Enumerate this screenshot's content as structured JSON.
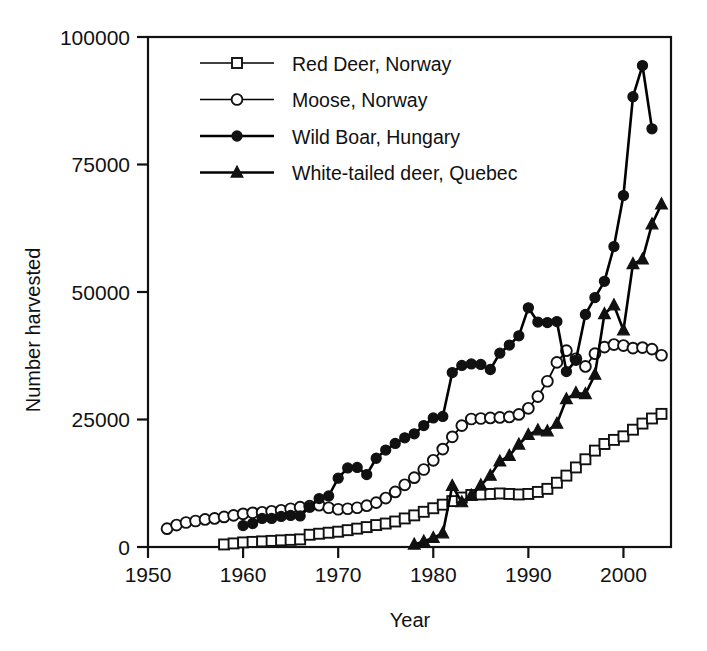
{
  "chart_data": {
    "type": "line",
    "title": "",
    "xlabel": "Year",
    "ylabel": "Number harvested",
    "xlim": [
      1950,
      2005
    ],
    "ylim": [
      0,
      100000
    ],
    "grid": false,
    "legend_position": "top-left-inside",
    "xticks": [
      1950,
      1960,
      1970,
      1980,
      1990,
      2000
    ],
    "yticks": [
      0,
      25000,
      50000,
      75000,
      100000
    ],
    "xtick_labels": [
      "1950",
      "1960",
      "1970",
      "1980",
      "1990",
      "2000"
    ],
    "ytick_labels": [
      "0",
      "25000",
      "50000",
      "75000",
      "100000"
    ],
    "series": [
      {
        "name": "Red Deer, Norway",
        "marker": "open-square",
        "color": "#000000",
        "x": [
          1958,
          1959,
          1960,
          1961,
          1962,
          1963,
          1964,
          1965,
          1966,
          1967,
          1968,
          1969,
          1970,
          1971,
          1972,
          1973,
          1974,
          1975,
          1976,
          1977,
          1978,
          1979,
          1980,
          1981,
          1982,
          1983,
          1984,
          1985,
          1986,
          1987,
          1988,
          1989,
          1990,
          1991,
          1992,
          1993,
          1994,
          1995,
          1996,
          1997,
          1998,
          1999,
          2000,
          2001,
          2002,
          2003,
          2004
        ],
        "y": [
          500,
          700,
          900,
          1000,
          1100,
          1200,
          1300,
          1400,
          1500,
          2400,
          2600,
          2800,
          3000,
          3300,
          3600,
          3900,
          4300,
          4600,
          5000,
          5600,
          6200,
          6900,
          7600,
          8300,
          9000,
          9700,
          10200,
          10300,
          10400,
          10500,
          10400,
          10300,
          10400,
          10800,
          11400,
          12600,
          14000,
          15600,
          17200,
          18900,
          20200,
          21000,
          21700,
          23000,
          24200,
          25200,
          26100
        ]
      },
      {
        "name": "Moose, Norway",
        "marker": "open-circle",
        "color": "#000000",
        "x": [
          1952,
          1953,
          1954,
          1955,
          1956,
          1957,
          1958,
          1959,
          1960,
          1961,
          1962,
          1963,
          1964,
          1965,
          1966,
          1967,
          1968,
          1969,
          1970,
          1971,
          1972,
          1973,
          1974,
          1975,
          1976,
          1977,
          1978,
          1979,
          1980,
          1981,
          1982,
          1983,
          1984,
          1985,
          1986,
          1987,
          1988,
          1989,
          1990,
          1991,
          1992,
          1993,
          1994,
          1995,
          1996,
          1997,
          1998,
          1999,
          2000,
          2001,
          2002,
          2003,
          2004
        ],
        "y": [
          3600,
          4300,
          4800,
          5100,
          5400,
          5600,
          5900,
          6200,
          6500,
          6700,
          6800,
          7000,
          7200,
          7500,
          7800,
          8000,
          8200,
          7700,
          7400,
          7500,
          7700,
          8100,
          8700,
          9600,
          10800,
          12200,
          13600,
          15200,
          17000,
          19200,
          21600,
          23800,
          25100,
          25200,
          25300,
          25400,
          25500,
          26000,
          27200,
          29500,
          32500,
          36200,
          38500,
          36900,
          35400,
          37900,
          39200,
          39700,
          39500,
          39000,
          39100,
          38800,
          37600
        ]
      },
      {
        "name": "Wild Boar, Hungary",
        "marker": "filled-circle",
        "color": "#000000",
        "x": [
          1960,
          1961,
          1962,
          1963,
          1964,
          1965,
          1966,
          1967,
          1968,
          1969,
          1970,
          1971,
          1972,
          1973,
          1974,
          1975,
          1976,
          1977,
          1978,
          1979,
          1980,
          1981,
          1982,
          1983,
          1984,
          1985,
          1986,
          1987,
          1988,
          1989,
          1990,
          1991,
          1992,
          1993,
          1994,
          1995,
          1996,
          1997,
          1998,
          1999,
          2000,
          2001,
          2002,
          2003
        ],
        "y": [
          4200,
          4600,
          5600,
          5600,
          6000,
          6200,
          6100,
          7800,
          9500,
          10000,
          13500,
          15500,
          15600,
          14200,
          17400,
          19000,
          20300,
          21400,
          22200,
          23800,
          25300,
          25600,
          34200,
          35600,
          35900,
          35800,
          34800,
          38000,
          39600,
          41400,
          46900,
          44100,
          44000,
          44200,
          34400,
          36600,
          45600,
          48900,
          52100,
          58900,
          68900,
          88300,
          94400,
          82000
        ]
      },
      {
        "name": "White-tailed deer, Quebec",
        "marker": "filled-triangle",
        "color": "#000000",
        "x": [
          1978,
          1979,
          1980,
          1981,
          1982,
          1983,
          1984,
          1985,
          1986,
          1987,
          1988,
          1989,
          1990,
          1991,
          1992,
          1993,
          1994,
          1995,
          1996,
          1997,
          1998,
          1999,
          2000,
          2001,
          2002,
          2003,
          2004
        ],
        "y": [
          500,
          1100,
          1800,
          2700,
          12000,
          8800,
          10100,
          12100,
          14000,
          16800,
          17900,
          20100,
          22000,
          22900,
          22700,
          24200,
          29000,
          30200,
          30000,
          33800,
          45700,
          47400,
          42500,
          55500,
          56400,
          63300,
          67200
        ]
      }
    ]
  }
}
